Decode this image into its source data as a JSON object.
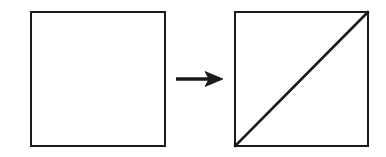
{
  "figure": {
    "title": "Square transformed into square with diagonal",
    "canvas": {
      "width": 386,
      "height": 157,
      "background_color": "#ffffff"
    },
    "stroke_color": "#1a1a1a",
    "fill_color": "#ffffff",
    "shapes": [
      {
        "id": "left-square",
        "role": "source-shape",
        "label": "Plain square",
        "type": "square",
        "x": 30,
        "y": 11,
        "width": 136,
        "height": 136,
        "stroke_width": 2.2,
        "fill": "#ffffff",
        "stroke": "#1a1a1a"
      },
      {
        "id": "right-square",
        "role": "result-shape",
        "label": "Square divided by diagonal",
        "type": "square",
        "x": 234,
        "y": 11,
        "width": 135,
        "height": 136,
        "stroke_width": 2.2,
        "fill": "#ffffff",
        "stroke": "#1a1a1a"
      }
    ],
    "diagonal": {
      "id": "right-square-diagonal",
      "label": "Diagonal from bottom-left to top-right",
      "x1": 234,
      "y1": 147,
      "x2": 369,
      "y2": 11,
      "stroke_width": 2.6,
      "stroke": "#1a1a1a"
    },
    "arrow": {
      "id": "transformation-arrow",
      "label": "Transformation arrow pointing right",
      "direction": "right",
      "shaft_x1": 176,
      "shaft_x2": 209,
      "shaft_y": 79,
      "shaft_width": 3.4,
      "head_tip_x": 223,
      "head_back_x": 205,
      "head_half_height": 7.5,
      "head_notch_x": 209,
      "stroke": "#1a1a1a",
      "fill": "#1a1a1a"
    }
  }
}
